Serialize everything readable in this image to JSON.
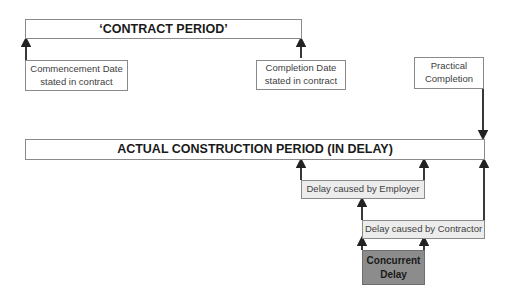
{
  "diagram": {
    "contract_period": {
      "label": "‘CONTRACT PERIOD’"
    },
    "commencement": {
      "line1": "Commencement Date",
      "line2": "stated in contract"
    },
    "completion": {
      "line1": "Completion Date",
      "line2": "stated in contract"
    },
    "practical_completion": {
      "line1": "Practical",
      "line2": "Completion"
    },
    "actual_period": {
      "label": "ACTUAL CONSTRUCTION PERIOD (IN DELAY)"
    },
    "employer_delay": {
      "label": "Delay caused by Employer"
    },
    "contractor_delay": {
      "label": "Delay caused by Contractor"
    },
    "concurrent_delay": {
      "line1": "Concurrent",
      "line2": "Delay"
    }
  },
  "colors": {
    "border": "#8a8a8a",
    "arrow": "#222222",
    "light_fill": "#ececec",
    "dark_fill": "#8c8c8c"
  }
}
